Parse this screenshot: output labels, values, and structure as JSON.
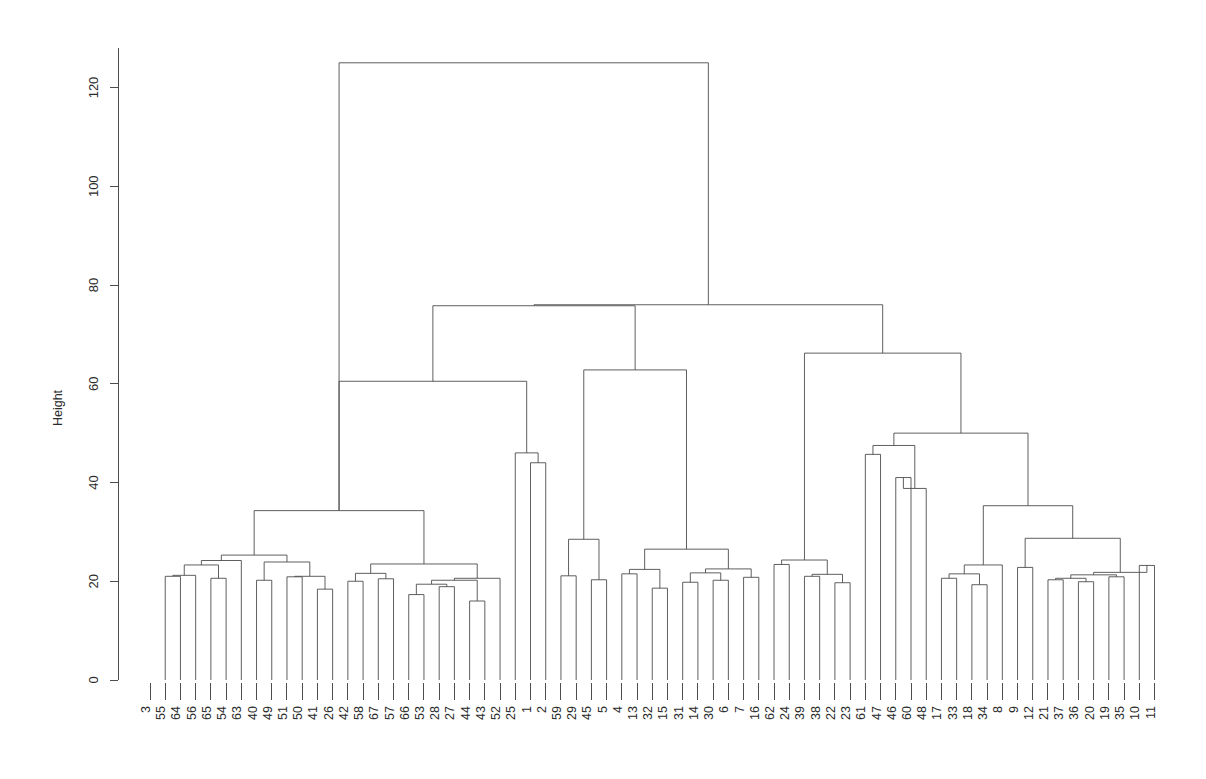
{
  "chart_data": {
    "type": "dendrogram",
    "title": "",
    "subtitle": "",
    "xlabel": "",
    "ylabel": "Height",
    "ylim": [
      0,
      128
    ],
    "yticks": [
      0,
      20,
      40,
      60,
      80,
      100,
      120
    ],
    "ytick_labels": [
      "0",
      "20",
      "40",
      "60",
      "80",
      "100",
      "120"
    ],
    "grid": false,
    "legend": null,
    "n_leaves": 67,
    "leaf_order": [
      "3",
      "55",
      "64",
      "56",
      "65",
      "54",
      "63",
      "40",
      "49",
      "51",
      "50",
      "41",
      "26",
      "42",
      "58",
      "67",
      "57",
      "66",
      "53",
      "28",
      "27",
      "44",
      "43",
      "52",
      "25",
      "1",
      "2",
      "59",
      "29",
      "45",
      "5",
      "4",
      "13",
      "32",
      "15",
      "31",
      "14",
      "30",
      "6",
      "7",
      "16",
      "62",
      "24",
      "39",
      "38",
      "22",
      "23",
      "61",
      "47",
      "46",
      "60",
      "48",
      "17",
      "33",
      "18",
      "34",
      "8",
      "9",
      "12",
      "21",
      "37",
      "36",
      "20",
      "19",
      "35",
      "10",
      "11"
    ],
    "merges": [
      {
        "id": "m1",
        "left": {
          "leaf": 55
        },
        "right": {
          "leaf": 64
        },
        "height": 21.0
      },
      {
        "id": "m2",
        "left": {
          "node": "m1"
        },
        "right": {
          "leaf": 56
        },
        "height": 21.2
      },
      {
        "id": "m3",
        "left": {
          "leaf": 65
        },
        "right": {
          "leaf": 54
        },
        "height": 20.6
      },
      {
        "id": "m4",
        "left": {
          "node": "m2"
        },
        "right": {
          "node": "m3"
        },
        "height": 23.3
      },
      {
        "id": "m5",
        "left": {
          "node": "m4"
        },
        "right": {
          "leaf": 63
        },
        "height": 24.2
      },
      {
        "id": "m6",
        "left": {
          "leaf": 40
        },
        "right": {
          "leaf": 49
        },
        "height": 20.2
      },
      {
        "id": "m7",
        "left": {
          "leaf": 51
        },
        "right": {
          "leaf": 50
        },
        "height": 20.9
      },
      {
        "id": "m8",
        "left": {
          "leaf": 41
        },
        "right": {
          "leaf": 26
        },
        "height": 18.4
      },
      {
        "id": "m9",
        "left": {
          "node": "m7"
        },
        "right": {
          "node": "m8"
        },
        "height": 21.0
      },
      {
        "id": "m10",
        "left": {
          "node": "m6"
        },
        "right": {
          "node": "m9"
        },
        "height": 23.9
      },
      {
        "id": "m11",
        "left": {
          "node": "m5"
        },
        "right": {
          "node": "m10"
        },
        "height": 25.3
      },
      {
        "id": "m12",
        "left": {
          "leaf": 42
        },
        "right": {
          "leaf": 58
        },
        "height": 20.0
      },
      {
        "id": "m13",
        "left": {
          "leaf": 67
        },
        "right": {
          "leaf": 57
        },
        "height": 20.5
      },
      {
        "id": "m14",
        "left": {
          "node": "m12"
        },
        "right": {
          "node": "m13"
        },
        "height": 21.6
      },
      {
        "id": "m15",
        "left": {
          "leaf": 66
        },
        "right": {
          "leaf": 53
        },
        "height": 17.3
      },
      {
        "id": "m16",
        "left": {
          "leaf": 28
        },
        "right": {
          "leaf": 27
        },
        "height": 18.9
      },
      {
        "id": "m17",
        "left": {
          "node": "m15"
        },
        "right": {
          "node": "m16"
        },
        "height": 19.4
      },
      {
        "id": "m18",
        "left": {
          "leaf": 44
        },
        "right": {
          "leaf": 43
        },
        "height": 16.0
      },
      {
        "id": "m19",
        "left": {
          "node": "m17"
        },
        "right": {
          "node": "m18"
        },
        "height": 20.2
      },
      {
        "id": "m20",
        "left": {
          "node": "m19"
        },
        "right": {
          "leaf": 52
        },
        "height": 20.6
      },
      {
        "id": "m21",
        "left": {
          "node": "m14"
        },
        "right": {
          "node": "m20"
        },
        "height": 23.5
      },
      {
        "id": "m22",
        "left": {
          "node": "m11"
        },
        "right": {
          "node": "m21"
        },
        "height": 34.3
      },
      {
        "id": "m23",
        "left": {
          "leaf": 1
        },
        "right": {
          "leaf": 2
        },
        "height": 44.0
      },
      {
        "id": "m24",
        "left": {
          "leaf": 25
        },
        "right": {
          "node": "m23"
        },
        "height": 46.0
      },
      {
        "id": "m25",
        "left": {
          "node": "m22"
        },
        "right": {
          "node": "m24"
        },
        "height": 60.5
      },
      {
        "id": "m26",
        "left": {
          "leaf": 59
        },
        "right": {
          "leaf": 29
        },
        "height": 21.1
      },
      {
        "id": "m27",
        "left": {
          "leaf": 45
        },
        "right": {
          "leaf": 5
        },
        "height": 20.3
      },
      {
        "id": "m28",
        "left": {
          "node": "m26"
        },
        "right": {
          "node": "m27"
        },
        "height": 28.5
      },
      {
        "id": "m29",
        "left": {
          "leaf": 4
        },
        "right": {
          "leaf": 13
        },
        "height": 21.5
      },
      {
        "id": "m30",
        "left": {
          "leaf": 32
        },
        "right": {
          "leaf": 15
        },
        "height": 18.6
      },
      {
        "id": "m31",
        "left": {
          "node": "m29"
        },
        "right": {
          "node": "m30"
        },
        "height": 22.4
      },
      {
        "id": "m32",
        "left": {
          "leaf": 31
        },
        "right": {
          "leaf": 14
        },
        "height": 19.8
      },
      {
        "id": "m33",
        "left": {
          "leaf": 30
        },
        "right": {
          "leaf": 6
        },
        "height": 20.2
      },
      {
        "id": "m34",
        "left": {
          "node": "m32"
        },
        "right": {
          "node": "m33"
        },
        "height": 21.7
      },
      {
        "id": "m35",
        "left": {
          "leaf": 7
        },
        "right": {
          "leaf": 16
        },
        "height": 20.8
      },
      {
        "id": "m36",
        "left": {
          "node": "m34"
        },
        "right": {
          "node": "m35"
        },
        "height": 22.5
      },
      {
        "id": "m37",
        "left": {
          "node": "m31"
        },
        "right": {
          "node": "m36"
        },
        "height": 26.5
      },
      {
        "id": "m38",
        "left": {
          "node": "m28"
        },
        "right": {
          "node": "m37"
        },
        "height": 62.8
      },
      {
        "id": "m39",
        "left": {
          "node": "m25"
        },
        "right": {
          "node": "m38"
        },
        "height": 75.8
      },
      {
        "id": "m40",
        "left": {
          "leaf": 62
        },
        "right": {
          "leaf": 24
        },
        "height": 23.4
      },
      {
        "id": "m41",
        "left": {
          "leaf": 39
        },
        "right": {
          "leaf": 38
        },
        "height": 21.0
      },
      {
        "id": "m42",
        "left": {
          "leaf": 22
        },
        "right": {
          "leaf": 23
        },
        "height": 19.7
      },
      {
        "id": "m43",
        "left": {
          "node": "m41"
        },
        "right": {
          "node": "m42"
        },
        "height": 21.4
      },
      {
        "id": "m44",
        "left": {
          "node": "m40"
        },
        "right": {
          "node": "m43"
        },
        "height": 24.3
      },
      {
        "id": "m45",
        "left": {
          "leaf": 61
        },
        "right": {
          "leaf": 47
        },
        "height": 45.7
      },
      {
        "id": "m46",
        "left": {
          "leaf": 46
        },
        "right": {
          "leaf": 60
        },
        "height": 41.0
      },
      {
        "id": "m47",
        "left": {
          "node": "m46"
        },
        "right": {
          "leaf": 48
        },
        "height": 38.8
      },
      {
        "id": "m48",
        "left": {
          "node": "m45"
        },
        "right": {
          "node": "m47"
        },
        "height": 47.5
      },
      {
        "id": "m49",
        "left": {
          "leaf": 17
        },
        "right": {
          "leaf": 33
        },
        "height": 20.6
      },
      {
        "id": "m50",
        "left": {
          "leaf": 18
        },
        "right": {
          "leaf": 34
        },
        "height": 19.3
      },
      {
        "id": "m51",
        "left": {
          "node": "m49"
        },
        "right": {
          "node": "m50"
        },
        "height": 21.5
      },
      {
        "id": "m52",
        "left": {
          "node": "m51"
        },
        "right": {
          "leaf": 8
        },
        "height": 23.3
      },
      {
        "id": "m53",
        "left": {
          "leaf": 9
        },
        "right": {
          "leaf": 12
        },
        "height": 22.8
      },
      {
        "id": "m54",
        "left": {
          "leaf": 21
        },
        "right": {
          "leaf": 37
        },
        "height": 20.3
      },
      {
        "id": "m55",
        "left": {
          "leaf": 36
        },
        "right": {
          "leaf": 20
        },
        "height": 19.9
      },
      {
        "id": "m56",
        "left": {
          "node": "m54"
        },
        "right": {
          "node": "m55"
        },
        "height": 20.6
      },
      {
        "id": "m57",
        "left": {
          "leaf": 19
        },
        "right": {
          "leaf": 35
        },
        "height": 20.9
      },
      {
        "id": "m58",
        "left": {
          "node": "m56"
        },
        "right": {
          "node": "m57"
        },
        "height": 21.3
      },
      {
        "id": "m59",
        "left": {
          "leaf": 10
        },
        "right": {
          "leaf": 11
        },
        "height": 23.2
      },
      {
        "id": "m60",
        "left": {
          "node": "m58"
        },
        "right": {
          "node": "m59"
        },
        "height": 21.8
      },
      {
        "id": "m61",
        "left": {
          "node": "m53"
        },
        "right": {
          "node": "m60"
        },
        "height": 28.7
      },
      {
        "id": "m62",
        "left": {
          "node": "m52"
        },
        "right": {
          "node": "m61"
        },
        "height": 35.3
      },
      {
        "id": "m63",
        "left": {
          "node": "m48"
        },
        "right": {
          "node": "m62"
        },
        "height": 50.0
      },
      {
        "id": "m64",
        "left": {
          "node": "m44"
        },
        "right": {
          "node": "m63"
        },
        "height": 66.2
      },
      {
        "id": "m65",
        "left": {
          "node": "m39"
        },
        "right": {
          "node": "m64"
        },
        "height": 76.0
      },
      {
        "id": "m66",
        "left": {
          "node": "m22"
        },
        "right": {
          "node": "m65"
        },
        "height": 125.0
      }
    ]
  },
  "plot": {
    "axis_title": "Height",
    "root_height_label": "125",
    "line_color": "#4d4d4d",
    "background": "#ffffff",
    "text_color": "#2b2b2b"
  }
}
